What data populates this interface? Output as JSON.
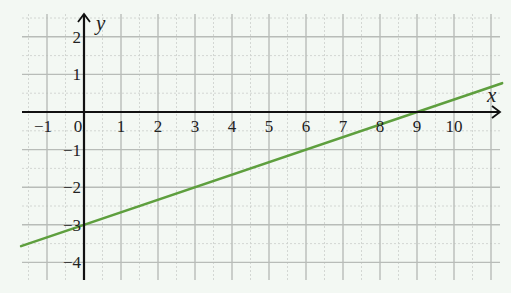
{
  "chart_data": {
    "type": "line",
    "title": "",
    "xlabel": "x",
    "ylabel": "y",
    "xlim": [
      -1.7,
      11.3
    ],
    "ylim": [
      -4.5,
      2.6
    ],
    "grid": true,
    "grid_minor_step": 0.5,
    "x_ticks": [
      -1,
      0,
      1,
      2,
      3,
      4,
      5,
      6,
      7,
      8,
      9,
      10
    ],
    "x_tick_labels": [
      "−1",
      "0",
      "1",
      "2",
      "3",
      "4",
      "5",
      "6",
      "7",
      "8",
      "9",
      "10"
    ],
    "y_ticks": [
      2,
      1,
      -1,
      -2,
      -3,
      -4
    ],
    "y_tick_labels": [
      "2",
      "1",
      "−1",
      "−2",
      "−3",
      "−4"
    ],
    "series": [
      {
        "name": "y = x/3 − 3",
        "slope": 0.3333,
        "intercept": -3,
        "x": [
          -1.7,
          11.3
        ],
        "y": [
          -3.567,
          0.767
        ],
        "color": "#5e9f3e"
      }
    ],
    "annotations": [
      "y-intercept at (0, −3)",
      "x-intercept at (9, 0)"
    ]
  },
  "colors": {
    "background": "#f3f8f3",
    "grid_major": "#b8bcb8",
    "grid_minor": "#cfd3cf",
    "axis": "#111111",
    "line": "#5e9f3e"
  }
}
